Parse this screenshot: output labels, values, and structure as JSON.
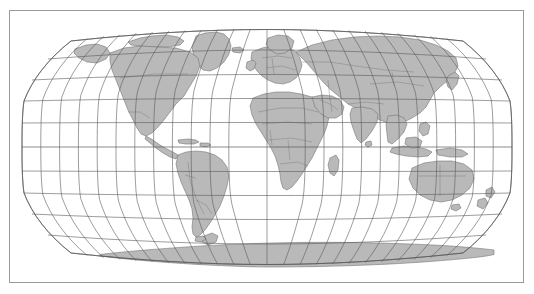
{
  "figure": {
    "kind": "world-map",
    "title": "",
    "caption": "",
    "background_color": "#ffffff"
  },
  "frame": {
    "visible": true,
    "stroke_color": "#9a9a9a",
    "x": 9,
    "y": 10,
    "width": 515,
    "height": 273
  },
  "map": {
    "projection": "Robinson",
    "central_meridian": 0,
    "ocean_color": "#ffffff",
    "land_color": "#b9b9b9",
    "coastline_color": "#6e6e6e",
    "country_border_color": "#7a7a7a",
    "graticule_color": "#5a5a5a",
    "outline_color": "#5a5a5a",
    "bounds_px": {
      "left": 22,
      "right": 512,
      "top": 27,
      "bottom": 267
    }
  },
  "graticule": {
    "meridian_interval_deg": 15,
    "parallel_interval_deg": 15,
    "meridians_deg": [
      -180,
      -165,
      -150,
      -135,
      -120,
      -105,
      -90,
      -75,
      -60,
      -45,
      -30,
      -15,
      0,
      15,
      30,
      45,
      60,
      75,
      90,
      105,
      120,
      135,
      150,
      165,
      180
    ],
    "parallels_deg": [
      -75,
      -60,
      -45,
      -30,
      -15,
      0,
      15,
      30,
      45,
      60,
      75
    ],
    "equator_deg": 0,
    "labels_visible": false
  },
  "continents": [
    {
      "name": "North America"
    },
    {
      "name": "South America"
    },
    {
      "name": "Europe"
    },
    {
      "name": "Africa"
    },
    {
      "name": "Asia"
    },
    {
      "name": "Australia"
    },
    {
      "name": "Antarctica"
    },
    {
      "name": "Greenland"
    }
  ],
  "chart_data": {
    "type": "map",
    "title": "",
    "projection": "Robinson",
    "graticule_spacing_deg": 15,
    "longitude_range": [
      -180,
      180
    ],
    "latitude_range": [
      -90,
      90
    ],
    "features_shown": [
      "coastlines",
      "country-borders",
      "graticule",
      "land-fill"
    ],
    "legend": [],
    "annotations": []
  }
}
